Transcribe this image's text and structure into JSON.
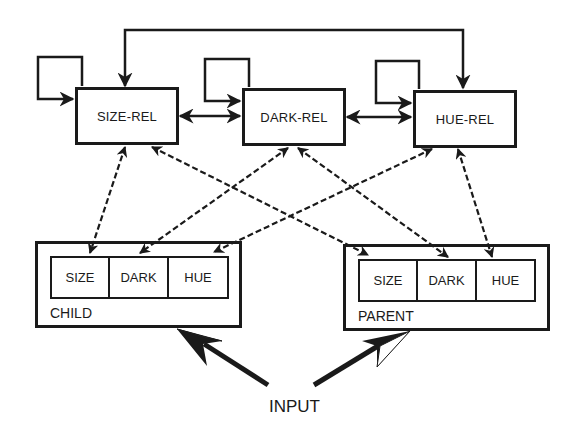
{
  "diagram": {
    "relation_nodes": [
      {
        "id": "size-rel",
        "label": "SIZE-REL"
      },
      {
        "id": "dark-rel",
        "label": "DARK-REL"
      },
      {
        "id": "hue-rel",
        "label": "HUE-REL"
      }
    ],
    "child": {
      "label": "CHILD",
      "cells": [
        "SIZE",
        "DARK",
        "HUE"
      ]
    },
    "parent": {
      "label": "PARENT",
      "cells": [
        "SIZE",
        "DARK",
        "HUE"
      ]
    },
    "input_label": "INPUT",
    "edges": [
      {
        "from": "size-rel",
        "to": "size-rel",
        "type": "self-loop"
      },
      {
        "from": "dark-rel",
        "to": "dark-rel",
        "type": "self-loop"
      },
      {
        "from": "hue-rel",
        "to": "hue-rel",
        "type": "self-loop"
      },
      {
        "from": "size-rel",
        "to": "dark-rel",
        "type": "bidirectional-solid"
      },
      {
        "from": "dark-rel",
        "to": "hue-rel",
        "type": "bidirectional-solid"
      },
      {
        "from": "size-rel",
        "to": "hue-rel",
        "type": "bidirectional-solid-top"
      },
      {
        "from": "size-rel",
        "to": "child.SIZE",
        "type": "bidirectional-dashed"
      },
      {
        "from": "size-rel",
        "to": "parent.SIZE",
        "type": "bidirectional-dashed"
      },
      {
        "from": "dark-rel",
        "to": "child.DARK",
        "type": "bidirectional-dashed"
      },
      {
        "from": "dark-rel",
        "to": "parent.DARK",
        "type": "bidirectional-dashed"
      },
      {
        "from": "hue-rel",
        "to": "child.HUE",
        "type": "bidirectional-dashed"
      },
      {
        "from": "hue-rel",
        "to": "parent.HUE",
        "type": "bidirectional-dashed"
      },
      {
        "from": "input",
        "to": "child",
        "type": "input-arrow"
      },
      {
        "from": "input",
        "to": "parent",
        "type": "input-arrow"
      }
    ]
  }
}
